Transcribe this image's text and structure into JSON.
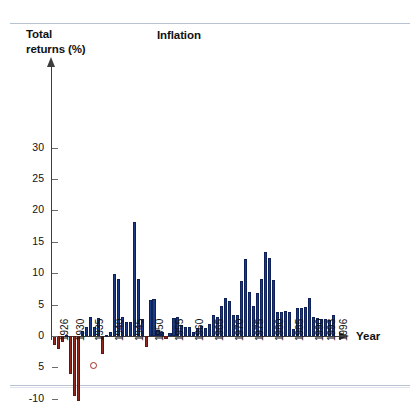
{
  "figure": {
    "y_axis_title_line1": "Total",
    "y_axis_title_line2": "returns (%)",
    "chart_title": "Inflation",
    "x_axis_title": "Year"
  },
  "chart_data": {
    "type": "bar",
    "title": "Inflation",
    "xlabel": "Year",
    "ylabel": "Total returns (%)",
    "ylim": [
      -10,
      33
    ],
    "grid": false,
    "legend_position": "none",
    "y_tick_labels": [
      "30",
      "25",
      "20",
      "15",
      "10",
      "5",
      "0",
      "5",
      "-10"
    ],
    "y_tick_values": [
      30,
      25,
      20,
      15,
      10,
      5,
      0,
      -5,
      -10
    ],
    "x_tick_labels": [
      "1926",
      "1930",
      "1935",
      "1940",
      "1945",
      "1950",
      "1955",
      "1960",
      "1965",
      "1970",
      "1975",
      "1980",
      "1985",
      "1990",
      "1993",
      "1996"
    ],
    "positive_color": "#1d3a87",
    "negative_color": "#93281f",
    "annotation_marker": "red-open-circle-below-1935",
    "categories": [
      1926,
      1927,
      1928,
      1929,
      1930,
      1931,
      1932,
      1933,
      1934,
      1935,
      1936,
      1937,
      1938,
      1939,
      1940,
      1941,
      1942,
      1943,
      1944,
      1945,
      1946,
      1947,
      1948,
      1949,
      1950,
      1951,
      1952,
      1953,
      1954,
      1955,
      1956,
      1957,
      1958,
      1959,
      1960,
      1961,
      1962,
      1963,
      1964,
      1965,
      1966,
      1967,
      1968,
      1969,
      1970,
      1971,
      1972,
      1973,
      1974,
      1975,
      1976,
      1977,
      1978,
      1979,
      1980,
      1981,
      1982,
      1983,
      1984,
      1985,
      1986,
      1987,
      1988,
      1989,
      1990,
      1991,
      1992,
      1993,
      1994,
      1995,
      1996
    ],
    "values": [
      -1.5,
      -2.1,
      -1.0,
      0.2,
      -6.0,
      -9.5,
      -10.3,
      0.8,
      1.5,
      3.0,
      1.4,
      2.9,
      -2.8,
      0.0,
      0.7,
      9.9,
      9.0,
      3.0,
      2.3,
      2.2,
      18.2,
      9.0,
      2.7,
      -1.8,
      5.8,
      5.9,
      0.9,
      0.6,
      -0.5,
      0.4,
      2.9,
      3.0,
      1.8,
      1.5,
      1.5,
      0.7,
      1.2,
      1.6,
      1.2,
      1.9,
      3.4,
      3.0,
      4.7,
      6.1,
      5.5,
      3.4,
      3.4,
      8.8,
      12.2,
      7.0,
      4.8,
      6.8,
      9.0,
      13.3,
      12.4,
      8.9,
      3.9,
      3.8,
      4.0,
      3.8,
      1.1,
      4.4,
      4.4,
      4.6,
      6.1,
      3.1,
      2.9,
      2.7,
      2.7,
      2.5,
      3.3
    ]
  }
}
